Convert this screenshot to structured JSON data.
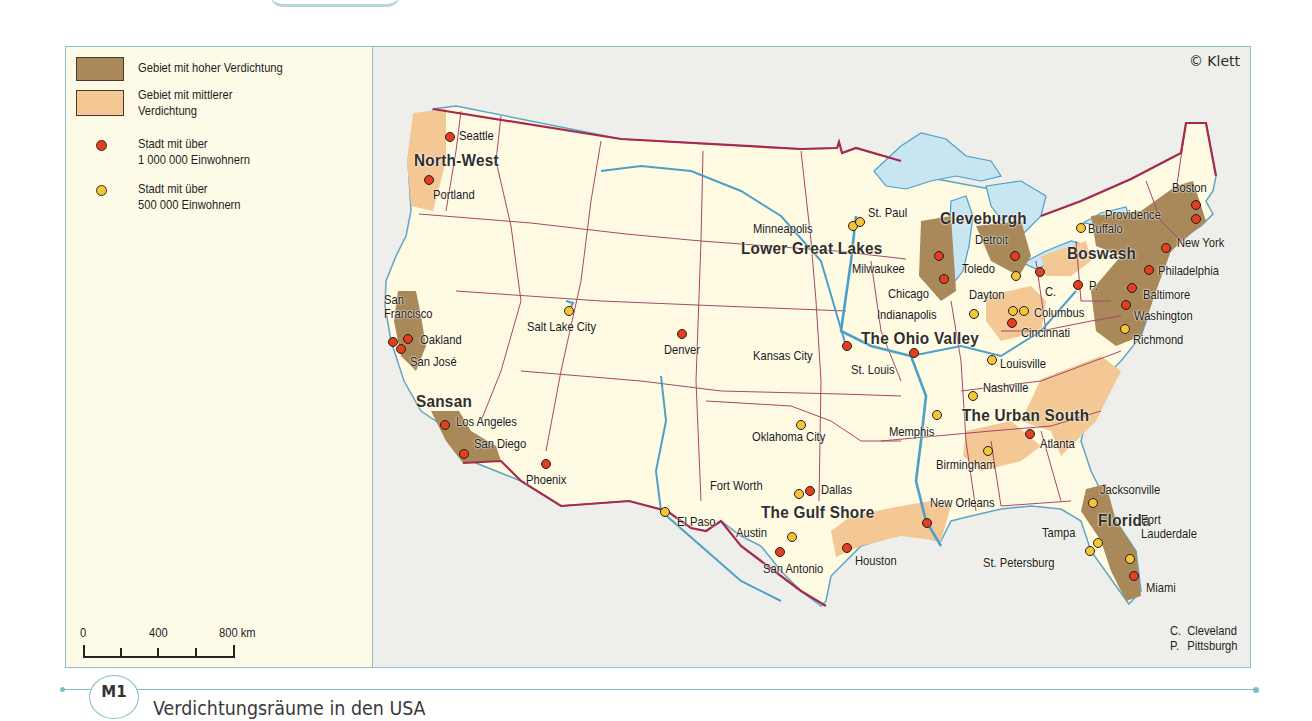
{
  "map": {
    "copyright": "© Klett",
    "legend": {
      "items": [
        {
          "type": "area",
          "label": "Gebiet mit hoher Verdichtung",
          "color": "#a9885a"
        },
        {
          "type": "area",
          "label_line1": "Gebiet mit mittlerer",
          "label_line2": "Verdichtung",
          "color": "#f4c895"
        },
        {
          "type": "point",
          "label_line1": "Stadt mit über",
          "label_line2": "1 000 000 Einwohnern",
          "color": "#e0401f"
        },
        {
          "type": "point",
          "label_line1": "Stadt mit über",
          "label_line2": "500 000 Einwohnern",
          "color": "#f2c83a"
        }
      ]
    },
    "scale": {
      "labels": [
        "0",
        "400",
        "800 km"
      ]
    },
    "abbreviations": [
      {
        "abbr": "C.",
        "name": "Cleveland"
      },
      {
        "abbr": "P.",
        "name": "Pittsburgh"
      }
    ],
    "regions": [
      {
        "name": "North-West",
        "x": 414,
        "y": 152
      },
      {
        "name": "Sansan",
        "x": 416,
        "y": 393
      },
      {
        "name": "Lower Great Lakes",
        "x": 741,
        "y": 240
      },
      {
        "name": "Cleveburgh",
        "x": 940,
        "y": 210
      },
      {
        "name": "Boswash",
        "x": 1067,
        "y": 245
      },
      {
        "name": "The Ohio Valley",
        "x": 861,
        "y": 330
      },
      {
        "name": "The Urban South",
        "x": 962,
        "y": 407
      },
      {
        "name": "The Gulf Shore",
        "x": 761,
        "y": 504
      },
      {
        "name": "Florida",
        "x": 1098,
        "y": 512
      }
    ],
    "cities": [
      {
        "name": "Seattle",
        "size": "big",
        "dot": [
          450,
          137
        ],
        "label": [
          459,
          129
        ]
      },
      {
        "name": "Portland",
        "size": "big",
        "dot": [
          429,
          180
        ],
        "label": [
          433,
          188
        ]
      },
      {
        "name": "San Francisco",
        "size": "big",
        "dot": [
          393,
          342
        ],
        "label": [
          384,
          293
        ],
        "multiline": [
          "San",
          "Francisco"
        ]
      },
      {
        "name": "Oakland",
        "size": "big",
        "dot": [
          408,
          339
        ],
        "label": [
          420,
          333
        ]
      },
      {
        "name": "San José",
        "size": "big",
        "dot": [
          401,
          349
        ],
        "label": [
          410,
          355
        ]
      },
      {
        "name": "Los Angeles",
        "size": "big",
        "dot": [
          445,
          425
        ],
        "label": [
          456,
          415
        ]
      },
      {
        "name": "San Diego",
        "size": "big",
        "dot": [
          464,
          454
        ],
        "label": [
          474,
          437
        ]
      },
      {
        "name": "Phoenix",
        "size": "big",
        "dot": [
          546,
          464
        ],
        "label": [
          526,
          473
        ]
      },
      {
        "name": "Salt Lake City",
        "size": "mid",
        "dot": [
          569,
          311
        ],
        "label": [
          527,
          320
        ]
      },
      {
        "name": "Denver",
        "size": "big",
        "dot": [
          682,
          334
        ],
        "label": [
          664,
          343
        ]
      },
      {
        "name": "Kansas City",
        "size": "big",
        "dot": [
          847,
          346
        ],
        "label": [
          753,
          349
        ]
      },
      {
        "name": "St. Louis",
        "size": "big",
        "dot": [
          914,
          353
        ],
        "label": [
          851,
          363
        ]
      },
      {
        "name": "Oklahoma City",
        "size": "mid",
        "dot": [
          801,
          425
        ],
        "label": [
          752,
          430
        ]
      },
      {
        "name": "Fort Worth",
        "size": "mid",
        "dot": [
          799,
          494
        ],
        "label": [
          710,
          479
        ]
      },
      {
        "name": "Dallas",
        "size": "big",
        "dot": [
          810,
          491
        ],
        "label": [
          821,
          483
        ]
      },
      {
        "name": "El Paso",
        "size": "mid",
        "dot": [
          665,
          512
        ],
        "label": [
          677,
          515
        ]
      },
      {
        "name": "Austin",
        "size": "mid",
        "dot": [
          792,
          537
        ],
        "label": [
          736,
          526
        ]
      },
      {
        "name": "San Antonio",
        "size": "big",
        "dot": [
          780,
          552
        ],
        "label": [
          763,
          562
        ]
      },
      {
        "name": "Houston",
        "size": "big",
        "dot": [
          847,
          548
        ],
        "label": [
          855,
          554
        ]
      },
      {
        "name": "Minneapolis",
        "size": "mid",
        "dot": [
          853,
          226
        ],
        "label": [
          753,
          222
        ]
      },
      {
        "name": "St. Paul",
        "size": "mid",
        "dot": [
          860,
          222
        ],
        "label": [
          868,
          206
        ]
      },
      {
        "name": "Milwaukee",
        "size": "big",
        "dot": [
          939,
          256
        ],
        "label": [
          852,
          262
        ]
      },
      {
        "name": "Chicago",
        "size": "big",
        "dot": [
          944,
          279
        ],
        "label": [
          888,
          287
        ]
      },
      {
        "name": "Detroit",
        "size": "big",
        "dot": [
          1015,
          256
        ],
        "label": [
          975,
          233
        ]
      },
      {
        "name": "Toledo",
        "size": "mid",
        "dot": [
          1016,
          276
        ],
        "label": [
          962,
          262
        ]
      },
      {
        "name": "C.",
        "size": "big",
        "dot": [
          1040,
          272
        ],
        "label": [
          1045,
          285
        ]
      },
      {
        "name": "P.",
        "size": "big",
        "dot": [
          1078,
          285
        ],
        "label": [
          1089,
          279
        ]
      },
      {
        "name": "Dayton",
        "size": "mid",
        "dot": [
          1013,
          311
        ],
        "label": [
          969,
          288
        ]
      },
      {
        "name": "Indianapolis",
        "size": "mid",
        "dot": [
          974,
          314
        ],
        "label": [
          877,
          308
        ]
      },
      {
        "name": "Columbus",
        "size": "mid",
        "dot": [
          1024,
          311
        ],
        "label": [
          1034,
          306
        ]
      },
      {
        "name": "Cincinnati",
        "size": "big",
        "dot": [
          1012,
          323
        ],
        "label": [
          1021,
          326
        ]
      },
      {
        "name": "Louisville",
        "size": "mid",
        "dot": [
          992,
          360
        ],
        "label": [
          1000,
          357
        ]
      },
      {
        "name": "Nashville",
        "size": "mid",
        "dot": [
          973,
          396
        ],
        "label": [
          983,
          381
        ]
      },
      {
        "name": "Memphis",
        "size": "mid",
        "dot": [
          937,
          415
        ],
        "label": [
          889,
          425
        ]
      },
      {
        "name": "Birmingham",
        "size": "mid",
        "dot": [
          988,
          451
        ],
        "label": [
          936,
          458
        ]
      },
      {
        "name": "Atlanta",
        "size": "big",
        "dot": [
          1030,
          434
        ],
        "label": [
          1040,
          437
        ]
      },
      {
        "name": "New Orleans",
        "size": "big",
        "dot": [
          927,
          523
        ],
        "label": [
          930,
          496
        ]
      },
      {
        "name": "Jacksonville",
        "size": "mid",
        "dot": [
          1093,
          503
        ],
        "label": [
          1100,
          483
        ]
      },
      {
        "name": "Tampa",
        "size": "mid",
        "dot": [
          1098,
          543
        ],
        "label": [
          1042,
          526
        ]
      },
      {
        "name": "St. Petersburg",
        "size": "mid",
        "dot": [
          1090,
          551
        ],
        "label": [
          983,
          556
        ]
      },
      {
        "name": "Fort Lauderdale",
        "size": "mid",
        "dot": [
          1130,
          559
        ],
        "label": [
          1141,
          513
        ],
        "multiline": [
          "Fort",
          "Lauderdale"
        ]
      },
      {
        "name": "Miami",
        "size": "big",
        "dot": [
          1134,
          576
        ],
        "label": [
          1146,
          581
        ]
      },
      {
        "name": "Buffalo",
        "size": "mid",
        "dot": [
          1081,
          228
        ],
        "label": [
          1088,
          222
        ]
      },
      {
        "name": "Boston",
        "size": "big",
        "dot": [
          1196,
          205
        ],
        "label": [
          1172,
          181
        ]
      },
      {
        "name": "Providence",
        "size": "big",
        "dot": [
          1196,
          219
        ],
        "label": [
          1105,
          208
        ]
      },
      {
        "name": "New York",
        "size": "big",
        "dot": [
          1166,
          248
        ],
        "label": [
          1177,
          236
        ]
      },
      {
        "name": "Philadelphia",
        "size": "big",
        "dot": [
          1149,
          270
        ],
        "label": [
          1158,
          264
        ]
      },
      {
        "name": "Baltimore",
        "size": "big",
        "dot": [
          1132,
          288
        ],
        "label": [
          1143,
          288
        ]
      },
      {
        "name": "Washington",
        "size": "big",
        "dot": [
          1126,
          305
        ],
        "label": [
          1134,
          309
        ]
      },
      {
        "name": "Richmond",
        "size": "mid",
        "dot": [
          1125,
          329
        ],
        "label": [
          1133,
          333
        ]
      }
    ]
  },
  "figure": {
    "badge": "M1",
    "caption": "Verdichtungsräume in den USA"
  }
}
